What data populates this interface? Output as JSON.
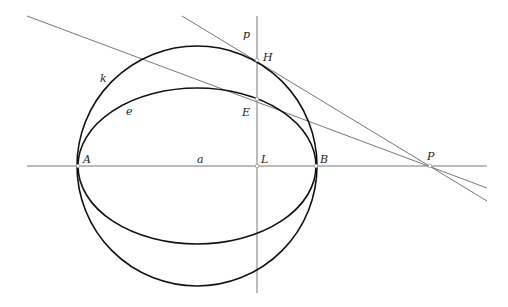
{
  "diagram": {
    "colors": {
      "curve": "#111111",
      "line": "#777777",
      "background": "#ffffff"
    },
    "labels": {
      "k": "k",
      "e": "e",
      "p": "p",
      "H": "H",
      "E": "E",
      "A": "A",
      "a": "a",
      "L": "L",
      "B": "B",
      "P": "P"
    },
    "elements": {
      "circle_k": {
        "cx": 197,
        "cy": 166,
        "r": 121
      },
      "ellipse_e": {
        "cx": 197,
        "cy": 166,
        "rx": 120,
        "ry": 79
      },
      "axis_a": {
        "x1": 27,
        "y1": 166,
        "x2": 487,
        "y2": 166
      },
      "line_p": {
        "x1": 257,
        "y1": 16,
        "x2": 257,
        "y2": 293
      },
      "tangent_circle": {
        "x1": 182,
        "y1": 16,
        "x2": 487,
        "y2": 201
      },
      "tangent_ellipse": {
        "x1": 27,
        "y1": 16,
        "x2": 487,
        "y2": 188
      }
    },
    "points": {
      "A": [
        78,
        166
      ],
      "B": [
        316,
        166
      ],
      "L": [
        257,
        166
      ],
      "H": [
        257,
        60
      ],
      "E": [
        257,
        99
      ],
      "P": [
        430,
        166
      ]
    }
  }
}
